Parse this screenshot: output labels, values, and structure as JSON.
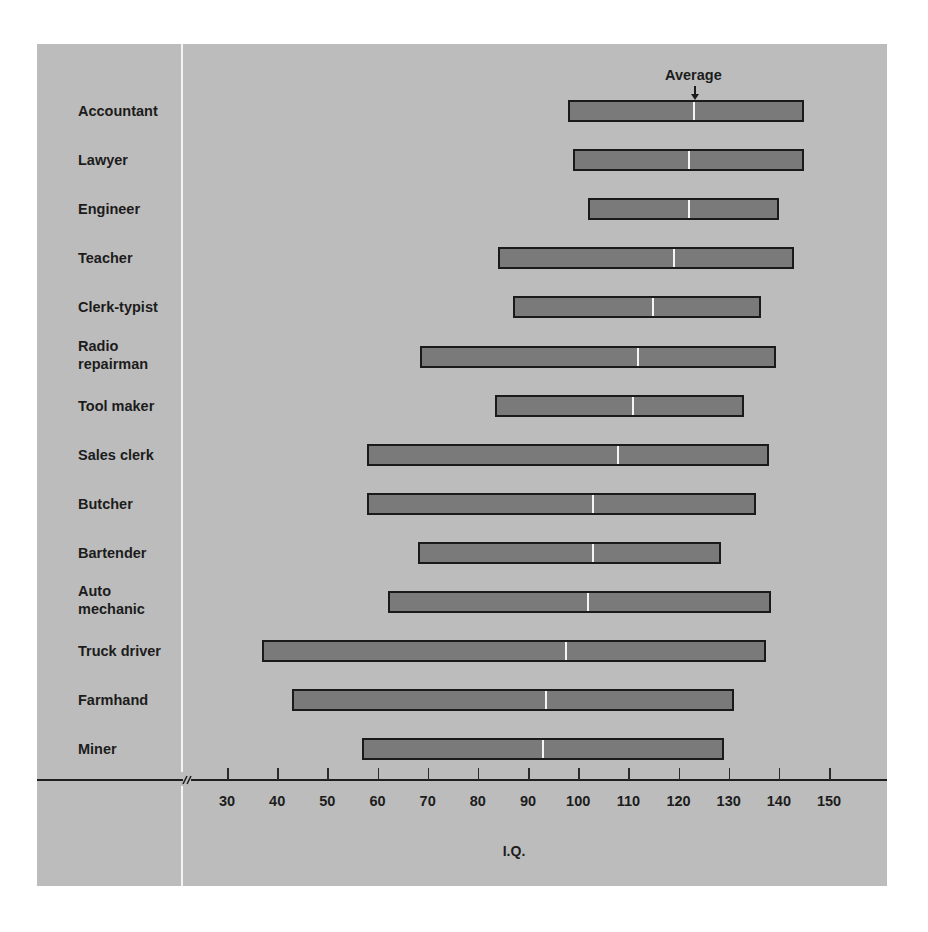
{
  "chart_data": {
    "type": "bar",
    "subtype": "horizontal-range",
    "title": "",
    "xlabel": "I.Q.",
    "ylabel": "",
    "xlim": [
      30,
      150
    ],
    "x_ticks": [
      30,
      40,
      50,
      60,
      70,
      80,
      90,
      100,
      110,
      120,
      130,
      140,
      150
    ],
    "axis_break": true,
    "grid": false,
    "legend": null,
    "annotation": {
      "text": "Average",
      "points_to": "Accountant average marker"
    },
    "categories": [
      "Accountant",
      "Lawyer",
      "Engineer",
      "Teacher",
      "Clerk-typist",
      "Radio repairman",
      "Tool maker",
      "Sales clerk",
      "Butcher",
      "Bartender",
      "Auto mechanic",
      "Truck driver",
      "Farmhand",
      "Miner"
    ],
    "series": [
      {
        "name": "min",
        "values": [
          98,
          99,
          102,
          84,
          87,
          68.5,
          83.5,
          58,
          58,
          68,
          62,
          37,
          43,
          57
        ]
      },
      {
        "name": "average",
        "values": [
          123,
          122,
          122,
          119,
          115,
          112,
          111,
          108,
          103,
          103,
          102,
          97.5,
          93.5,
          93
        ]
      },
      {
        "name": "max",
        "values": [
          145,
          145,
          140,
          143,
          136.5,
          139.5,
          133,
          138,
          135.5,
          128.5,
          138.5,
          137.5,
          131,
          129
        ]
      }
    ]
  },
  "labels": {
    "average": "Average",
    "xaxis_title": "I.Q.",
    "occupations": [
      {
        "lines": [
          "Accountant"
        ]
      },
      {
        "lines": [
          "Lawyer"
        ]
      },
      {
        "lines": [
          "Engineer"
        ]
      },
      {
        "lines": [
          "Teacher"
        ]
      },
      {
        "lines": [
          "Clerk-typist"
        ]
      },
      {
        "lines": [
          "Radio",
          "repairman"
        ]
      },
      {
        "lines": [
          "Tool maker"
        ]
      },
      {
        "lines": [
          "Sales clerk"
        ]
      },
      {
        "lines": [
          "Butcher"
        ]
      },
      {
        "lines": [
          "Bartender"
        ]
      },
      {
        "lines": [
          "Auto",
          "mechanic"
        ]
      },
      {
        "lines": [
          "Truck driver"
        ]
      },
      {
        "lines": [
          "Farmhand"
        ]
      },
      {
        "lines": [
          "Miner"
        ]
      }
    ],
    "ticks": [
      "30",
      "40",
      "50",
      "60",
      "70",
      "80",
      "90",
      "100",
      "110",
      "120",
      "130",
      "140",
      "150"
    ]
  },
  "colors": {
    "background": "#bcbcbc",
    "bar_fill": "#7a7a7a",
    "bar_border": "#1a1a1a",
    "average_marker": "#f5f5f5",
    "text": "#1c1c1c"
  }
}
